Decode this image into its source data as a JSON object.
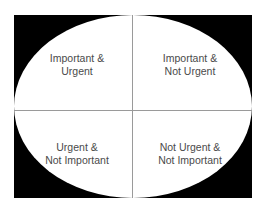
{
  "diagram": {
    "type": "priority-matrix",
    "colors": {
      "background": "#000000",
      "ellipse": "#ffffff",
      "divider": "#9a9a9a",
      "text": "#4a4a4a"
    },
    "quadrants": [
      {
        "position": "top-left",
        "line1": "Important &",
        "line2": "Urgent"
      },
      {
        "position": "top-right",
        "line1": "Important &",
        "line2": "Not Urgent"
      },
      {
        "position": "bottom-left",
        "line1": "Urgent &",
        "line2": "Not Important"
      },
      {
        "position": "bottom-right",
        "line1": "Not Urgent &",
        "line2": "Not Important"
      }
    ]
  }
}
